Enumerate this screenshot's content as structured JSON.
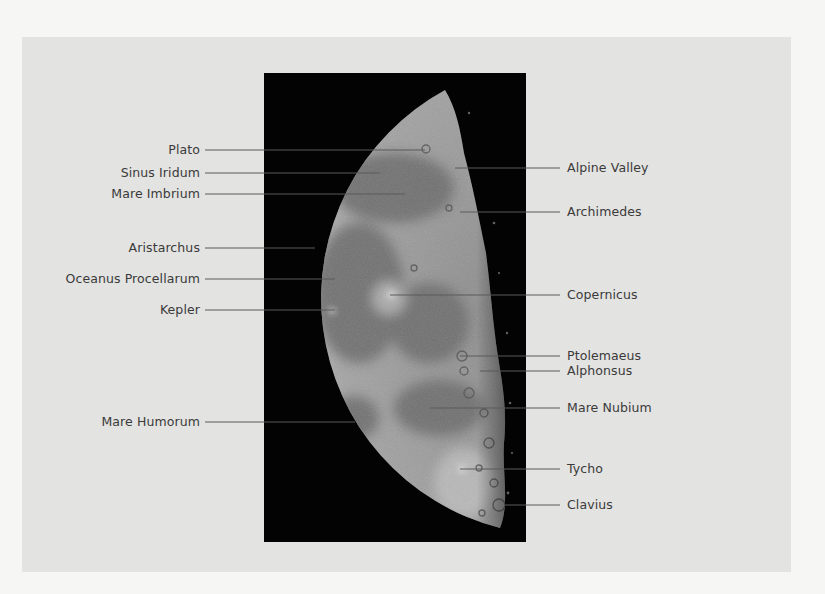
{
  "figure": {
    "colors": {
      "page": "#f6f6f4",
      "panel": "#e3e3e1",
      "photo_background": "#030303",
      "label_text": "#3a3a3a",
      "leader_line": "#5a5a5a"
    },
    "left_labels": [
      {
        "text": "Plato",
        "y": 150,
        "line_to_x": 425
      },
      {
        "text": "Sinus Iridum",
        "y": 173,
        "line_to_x": 380
      },
      {
        "text": "Mare Imbrium",
        "y": 194,
        "line_to_x": 405
      },
      {
        "text": "Aristarchus",
        "y": 248,
        "line_to_x": 315
      },
      {
        "text": "Oceanus Procellarum",
        "y": 279,
        "line_to_x": 335
      },
      {
        "text": "Kepler",
        "y": 310,
        "line_to_x": 335
      },
      {
        "text": "Mare Humorum",
        "y": 422,
        "line_to_x": 355
      }
    ],
    "right_labels": [
      {
        "text": "Alpine Valley",
        "y": 168,
        "line_from_x": 455
      },
      {
        "text": "Archimedes",
        "y": 212,
        "line_from_x": 460
      },
      {
        "text": "Copernicus",
        "y": 295,
        "line_from_x": 390
      },
      {
        "text": "Ptolemaeus",
        "y": 356,
        "line_from_x": 460
      },
      {
        "text": "Alphonsus",
        "y": 371,
        "line_from_x": 480
      },
      {
        "text": "Mare Nubium",
        "y": 408,
        "line_from_x": 430
      },
      {
        "text": "Tycho",
        "y": 469,
        "line_from_x": 460
      },
      {
        "text": "Clavius",
        "y": 505,
        "line_from_x": 505
      }
    ]
  }
}
